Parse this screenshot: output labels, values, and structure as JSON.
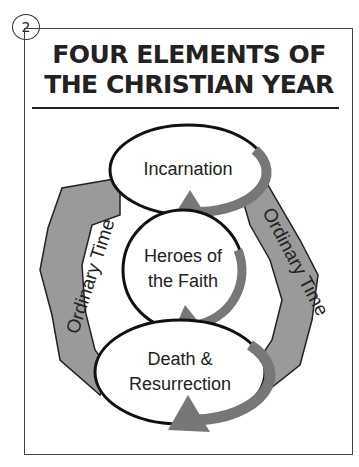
{
  "page_number": "2",
  "title": {
    "line1": "FOUR ELEMENTS OF",
    "line2": "THE CHRISTIAN YEAR"
  },
  "diagram": {
    "top_cycle": "Incarnation",
    "middle_cycle": [
      "Heroes of",
      "the Faith"
    ],
    "bottom_cycle": [
      "Death &",
      "Resurrection"
    ],
    "left_arrow": "Ordinary Time",
    "right_arrow": "Ordinary Time"
  },
  "colors": {
    "arrow_fill": "#9a9a9a",
    "arrow_dark": "#6b6b6b",
    "outline": "#111111"
  }
}
